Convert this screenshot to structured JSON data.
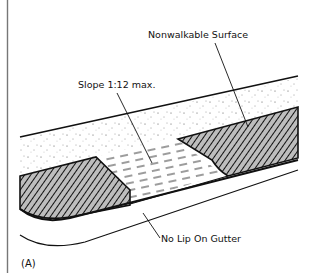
{
  "figure": {
    "panel_label": "(A)",
    "labels": {
      "nonwalkable_surface": "Nonwalkable Surface",
      "slope": "Slope 1:12 max.",
      "gutter": "No Lip On Gutter"
    },
    "colors": {
      "ink": "#111111",
      "frame": "#777777",
      "background": "#ffffff"
    }
  }
}
